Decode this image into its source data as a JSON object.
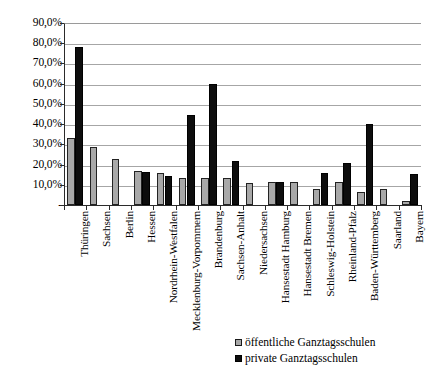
{
  "chart_data": {
    "type": "bar",
    "title": "",
    "xlabel": "",
    "ylabel": "",
    "ylim": [
      0,
      90
    ],
    "grid": true,
    "legend_position": "bottom-right",
    "ytick_labels": [
      "90,0%",
      "80,0%",
      "70,0%",
      "60,0%",
      "50,0%",
      "40,0%",
      "30,0%",
      "20,0%",
      "10,0%",
      "-"
    ],
    "ytick_values": [
      90,
      80,
      70,
      60,
      50,
      40,
      30,
      20,
      10,
      0
    ],
    "categories": [
      "Thüringen",
      "Sachsen",
      "Berlin",
      "Hessen",
      "Nordrhein-Westfalen",
      "Mecklenburg-Vorpommern",
      "Brandenburg",
      "Sachsen-Anhalt",
      "Niedersachsen",
      "Hansestadt Hamburg",
      "Hansestadt Bremen",
      "Schleswig-Holstein",
      "Rheinland-Pfalz",
      "Baden-Württemberg",
      "Saarland",
      "Bayern"
    ],
    "series": [
      {
        "name": "öffentliche Ganztagsschulen",
        "color": "#a8a8a8",
        "values": [
          33.0,
          28.5,
          23.0,
          17.0,
          16.0,
          13.5,
          13.5,
          13.5,
          11.0,
          11.5,
          11.5,
          8.0,
          11.5,
          6.5,
          8.0,
          2.0
        ]
      },
      {
        "name": "private Ganztagsschulen",
        "color": "#0d0d0d",
        "values": [
          78.0,
          0.0,
          0.0,
          16.5,
          14.5,
          44.5,
          60.0,
          22.0,
          0.0,
          11.5,
          0.0,
          16.0,
          21.0,
          40.0,
          0.0,
          15.5
        ]
      }
    ]
  },
  "legend": {
    "items": [
      {
        "label": "öffentliche Ganztagsschulen",
        "swatch": "pub"
      },
      {
        "label": "private Ganztagsschulen",
        "swatch": "priv"
      }
    ]
  }
}
